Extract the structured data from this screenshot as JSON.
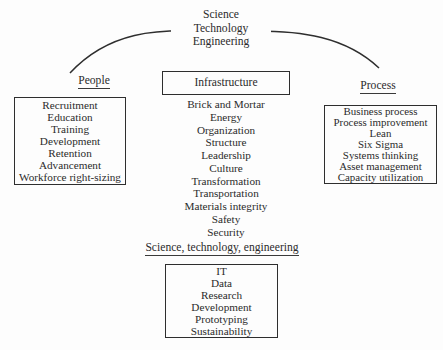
{
  "diagram": {
    "background_color": "#fdfdfd",
    "line_color": "#2e2e2e",
    "text_color": "#2b2b2b",
    "apex": {
      "lines": [
        "Science",
        "Technology",
        "Engineering"
      ]
    },
    "connector": {
      "shape": "arc",
      "left_endpoint_label": "People",
      "right_endpoint_label": "Process"
    },
    "pillars": {
      "people": {
        "heading": "People",
        "items": [
          "Recruitment",
          "Education",
          "Training",
          "Development",
          "Retention",
          "Advancement",
          "Workforce right-sizing"
        ]
      },
      "infrastructure": {
        "heading": "Infrastructure",
        "items": [
          "Brick and Mortar",
          "Energy",
          "Organization",
          "Structure",
          "Leadership",
          "Culture",
          "Transformation",
          "Transportation",
          "Materials integrity",
          "Safety",
          "Security"
        ]
      },
      "process": {
        "heading": "Process",
        "items": [
          "Business process",
          "Process improvement",
          "Lean",
          "Six Sigma",
          "Systems thinking",
          "Asset management",
          "Capacity utilization"
        ]
      },
      "ste": {
        "heading": "Science, technology, engineering",
        "items": [
          "IT",
          "Data",
          "Research",
          "Development",
          "Prototyping",
          "Sustainability"
        ]
      }
    }
  }
}
